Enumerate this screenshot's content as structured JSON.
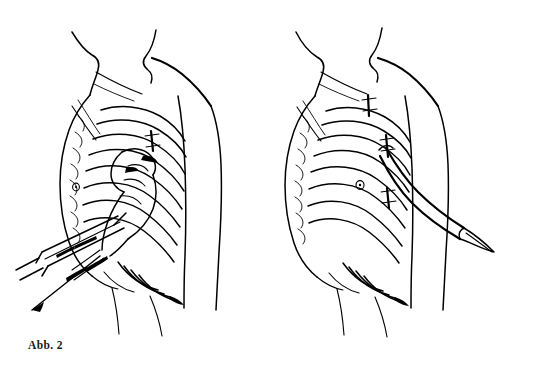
{
  "page": {
    "background_color": "#ffffff",
    "ink_color": "#000000",
    "width": 536,
    "height": 370,
    "style": "medical line drawing, pen and ink"
  },
  "figures": [
    {
      "id": "figure-left",
      "caption": "Abb. 2",
      "subject": "thoracentesis / pleural puncture",
      "description": "Line drawing of a human torso seen from the left front, with rib cage outlined, a hand gripping a syringe whose needle is inserted between the ribs of the lateral chest wall",
      "elements": [
        "neck-outline",
        "shoulder-and-arm-outline",
        "torso-outline",
        "rib-cage",
        "costal-margin",
        "nipple-marker",
        "hand-holding-syringe",
        "needle-at-insertion-site",
        "syringe-barrel",
        "syringe-plunger"
      ]
    },
    {
      "id": "figure-right",
      "caption": "Abb. 3",
      "subject": "chest tube / pleural drainage",
      "description": "Line drawing of the same torso with a drainage catheter emerging from an intercostal space and curving downward and outward across the arm, ending in a tapered tip",
      "elements": [
        "neck-outline",
        "shoulder-and-arm-outline",
        "torso-outline",
        "rib-cage",
        "costal-margin",
        "nipple-marker",
        "intercostal-marker-upper",
        "intercostal-marker-middle",
        "intercostal-marker-lower",
        "drainage-tube",
        "drainage-tube-tip"
      ]
    }
  ],
  "captions": {
    "left": "Abb. 2",
    "right": "Abb. 3"
  }
}
